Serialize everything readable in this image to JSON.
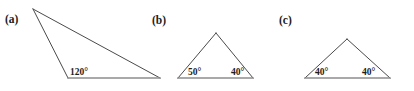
{
  "figure": {
    "background_color": "#ffffff",
    "edge_color": "#4a4a4a",
    "base_color": "#8c8c8c",
    "text_color": "#1c1c1c",
    "width": 414,
    "height": 91
  },
  "panels": [
    {
      "id": "a",
      "label": "(a)",
      "label_x": 5,
      "label_y": 23,
      "description": "obtuse scalene triangle",
      "vertices": {
        "apex": {
          "x": 33,
          "y": 9
        },
        "bottom_left": {
          "x": 68,
          "y": 78
        },
        "bottom_right": {
          "x": 160,
          "y": 78
        }
      },
      "angles": [
        {
          "name": "bottom-left-angle",
          "value": "120°",
          "x": 70,
          "y": 75,
          "vertex": "bottom_left"
        }
      ]
    },
    {
      "id": "b",
      "label": "(b)",
      "label_x": 152,
      "label_y": 24,
      "description": "acute scalene triangle",
      "vertices": {
        "apex": {
          "x": 216,
          "y": 33
        },
        "bottom_left": {
          "x": 178,
          "y": 78
        },
        "bottom_right": {
          "x": 253,
          "y": 78
        }
      },
      "angles": [
        {
          "name": "bottom-left-angle",
          "value": "50°",
          "x": 188,
          "y": 75,
          "vertex": "bottom_left"
        },
        {
          "name": "bottom-right-angle",
          "value": "40°",
          "x": 231,
          "y": 75,
          "vertex": "bottom_right"
        }
      ]
    },
    {
      "id": "c",
      "label": "(c)",
      "label_x": 279,
      "label_y": 24,
      "description": "isosceles triangle",
      "vertices": {
        "apex": {
          "x": 347,
          "y": 39
        },
        "bottom_left": {
          "x": 305,
          "y": 78
        },
        "bottom_right": {
          "x": 390,
          "y": 78
        }
      },
      "angles": [
        {
          "name": "bottom-left-angle",
          "value": "40°",
          "x": 315,
          "y": 75,
          "vertex": "bottom_left"
        },
        {
          "name": "bottom-right-angle",
          "value": "40°",
          "x": 362,
          "y": 75,
          "vertex": "bottom_right"
        }
      ]
    }
  ]
}
